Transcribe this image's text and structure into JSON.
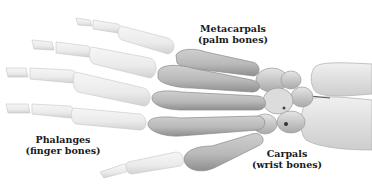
{
  "diagram": {
    "labels": {
      "metacarpals": {
        "name": "Metacarpals",
        "common": "(palm bones)"
      },
      "phalanges": {
        "name": "Phalanges",
        "common": "(finger bones)"
      },
      "carpals": {
        "name": "Carpals",
        "common": "(wrist bones)"
      }
    },
    "colors": {
      "phalanges_fill": "#ececec",
      "phalanges_stroke": "#c8c8c8",
      "metacarpals_fill": "#bdbdbd",
      "metacarpals_shadow": "#8e8e8e",
      "carpals_fill": "#d6d6d6",
      "forearm_fill": "#e4e4e4",
      "label_color": "#1a1a1a"
    }
  }
}
